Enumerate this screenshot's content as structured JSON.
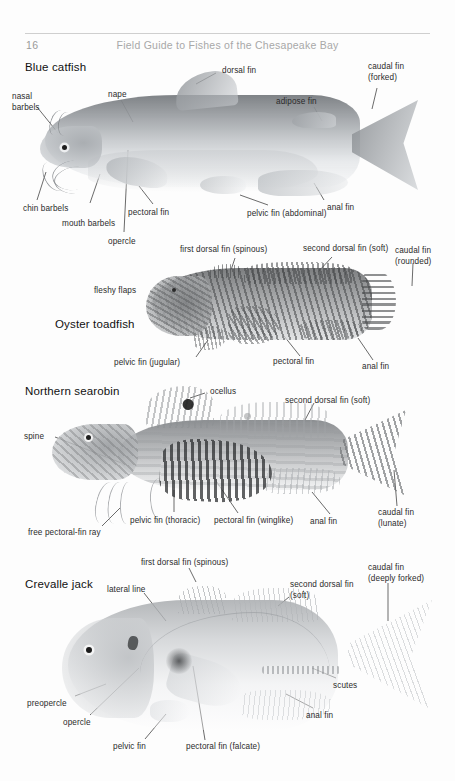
{
  "header": {
    "folio": "16",
    "running_head": "Field Guide to Fishes of the Chesapeake Bay"
  },
  "sections": [
    {
      "id": "blue-catfish",
      "name": "Blue catfish",
      "labels": [
        {
          "key": "nasal-barbels",
          "text": "nasal\nbarbels"
        },
        {
          "key": "nape",
          "text": "nape"
        },
        {
          "key": "dorsal-fin",
          "text": "dorsal fin"
        },
        {
          "key": "adipose-fin",
          "text": "adipose fin"
        },
        {
          "key": "caudal-fin",
          "text": "caudal fin\n(forked)"
        },
        {
          "key": "chin-barbels",
          "text": "chin barbels"
        },
        {
          "key": "mouth-barbels",
          "text": "mouth barbels"
        },
        {
          "key": "opercle",
          "text": "opercle"
        },
        {
          "key": "pectoral-fin",
          "text": "pectoral fin"
        },
        {
          "key": "pelvic-fin",
          "text": "pelvic fin (abdominal)"
        },
        {
          "key": "anal-fin",
          "text": "anal fin"
        }
      ]
    },
    {
      "id": "oyster-toadfish",
      "name": "Oyster toadfish",
      "labels": [
        {
          "key": "fleshy-flaps",
          "text": "fleshy flaps"
        },
        {
          "key": "first-dorsal-fin",
          "text": "first dorsal fin (spinous)"
        },
        {
          "key": "second-dorsal-fin",
          "text": "second dorsal fin (soft)"
        },
        {
          "key": "caudal-fin",
          "text": "caudal fin\n(rounded)"
        },
        {
          "key": "pelvic-fin",
          "text": "pelvic fin (jugular)"
        },
        {
          "key": "pectoral-fin",
          "text": "pectoral fin"
        },
        {
          "key": "anal-fin",
          "text": "anal fin"
        }
      ]
    },
    {
      "id": "northern-searobin",
      "name": "Northern searobin",
      "labels": [
        {
          "key": "ocellus",
          "text": "ocellus"
        },
        {
          "key": "second-dorsal-fin",
          "text": "second dorsal fin (soft)"
        },
        {
          "key": "spine",
          "text": "spine"
        },
        {
          "key": "free-pectoral-fin-ray",
          "text": "free pectoral-fin ray"
        },
        {
          "key": "pelvic-fin",
          "text": "pelvic fin (thoracic)"
        },
        {
          "key": "pectoral-fin",
          "text": "pectoral fin (winglike)"
        },
        {
          "key": "anal-fin",
          "text": "anal fin"
        },
        {
          "key": "caudal-fin",
          "text": "caudal fin\n(lunate)"
        }
      ]
    },
    {
      "id": "crevalle-jack",
      "name": "Crevalle jack",
      "labels": [
        {
          "key": "first-dorsal-fin",
          "text": "first dorsal fin (spinous)"
        },
        {
          "key": "lateral-line",
          "text": "lateral line"
        },
        {
          "key": "second-dorsal-fin",
          "text": "second dorsal fin\n(soft)"
        },
        {
          "key": "caudal-fin",
          "text": "caudal fin\n(deeply forked)"
        },
        {
          "key": "preopercle",
          "text": "preopercle"
        },
        {
          "key": "opercle",
          "text": "opercle"
        },
        {
          "key": "pelvic-fin",
          "text": "pelvic fin"
        },
        {
          "key": "pectoral-fin",
          "text": "pectoral fin (falcate)"
        },
        {
          "key": "scutes",
          "text": "scutes"
        },
        {
          "key": "anal-fin",
          "text": "anal fin"
        }
      ]
    }
  ],
  "colors": {
    "page_background": "#fdfdfd",
    "rule": "#cfcfcf",
    "folio_text": "#9a9a9a",
    "running_head_text": "#a8a8a8",
    "label_text": "#2b2b2b",
    "heading_text": "#111111"
  }
}
